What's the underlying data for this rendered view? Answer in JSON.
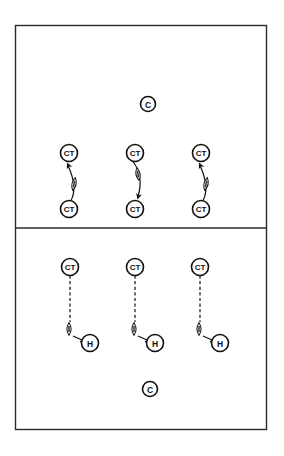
{
  "diagram": {
    "type": "football-drill",
    "line_color": "#111111",
    "background": "#ffffff",
    "sections": [
      {
        "name": "top-drill",
        "coach": {
          "label": "C"
        },
        "groups": [
          {
            "from": {
              "label": "CT"
            },
            "to": {
              "label": "CT"
            },
            "pass_direction": "up"
          },
          {
            "from": {
              "label": "CT"
            },
            "to": {
              "label": "CT"
            },
            "pass_direction": "down"
          },
          {
            "from": {
              "label": "CT"
            },
            "to": {
              "label": "CT"
            },
            "pass_direction": "up"
          }
        ]
      },
      {
        "name": "bottom-drill",
        "coach": {
          "label": "C"
        },
        "groups": [
          {
            "player": {
              "label": "CT"
            },
            "holder": {
              "label": "H"
            },
            "route": "dashed"
          },
          {
            "player": {
              "label": "CT"
            },
            "holder": {
              "label": "H"
            },
            "route": "dashed"
          },
          {
            "player": {
              "label": "CT"
            },
            "holder": {
              "label": "H"
            },
            "route": "dashed"
          }
        ]
      }
    ]
  }
}
